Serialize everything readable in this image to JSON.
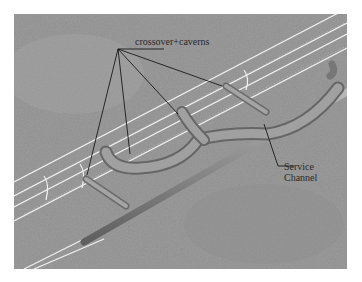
{
  "diagram": {
    "type": "tunnel layout illustration",
    "labels": {
      "crossover_caverns": "crossover+caverns",
      "service_channel_line1": "Service",
      "service_channel_line2": "Channel"
    },
    "colors": {
      "background_rock": "#9a9a9a",
      "tunnel_outline": "#f2f2f2",
      "service_tube": "#8c8c8c",
      "leader_lines": "#1a1a1a"
    }
  }
}
